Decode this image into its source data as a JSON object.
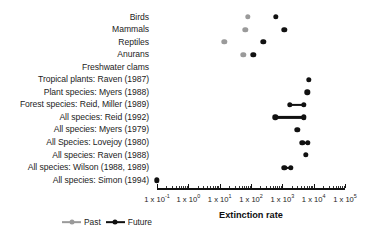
{
  "chart_data": {
    "type": "scatter",
    "title": "",
    "xlabel": "Extinction rate",
    "ylabel": "",
    "xscale": "log",
    "xlim": [
      0.1,
      100000
    ],
    "grid": false,
    "legend_position": "bottom-left",
    "tick_labels": [
      {
        "text": "1 x 10",
        "exp": "-1",
        "value": 0.1
      },
      {
        "text": "1 x 10",
        "exp": "0",
        "value": 1
      },
      {
        "text": "1 x 10",
        "exp": "1",
        "value": 10
      },
      {
        "text": "1 x 10",
        "exp": "2",
        "value": 100
      },
      {
        "text": "1 x 10",
        "exp": "3",
        "value": 1000
      },
      {
        "text": "1 x 10",
        "exp": "4",
        "value": 10000
      },
      {
        "text": "1 x 10",
        "exp": "5",
        "value": 100000
      }
    ],
    "series": [
      {
        "name": "Past",
        "color": "#9a9a9a"
      },
      {
        "name": "Future",
        "color": "#111111"
      }
    ],
    "categories": [
      "Birds",
      "Mammals",
      "Reptiles",
      "Anurans",
      "Freshwater clams",
      "Tropical plants: Raven (1987)",
      "Plant species: Myers (1988)",
      "Forest species: Reid, Miller (1989)",
      "All species: Reid (1992)",
      "All species: Myers (1979)",
      "All Species: Lovejoy (1980)",
      "All species: Raven (1988)",
      "All species: Wilson (1988, 1989)",
      "All species: Simon (1994)"
    ],
    "rows": [
      {
        "label": "Birds",
        "past": 80,
        "future": 630,
        "range": null
      },
      {
        "label": "Mammals",
        "past": 66,
        "future": 1150,
        "range": null
      },
      {
        "label": "Reptiles",
        "past": 14,
        "future": 250,
        "range": null
      },
      {
        "label": "Anurans",
        "past": 56,
        "future": 120,
        "range": null
      },
      {
        "label": "Freshwater clams",
        "past": null,
        "future": null,
        "range": null
      },
      {
        "label": "Tropical plants: Raven (1987)",
        "past": null,
        "future": 7000,
        "range": null
      },
      {
        "label": "Plant species: Myers (1988)",
        "past": null,
        "future": 6300,
        "range": null
      },
      {
        "label": "Forest species: Reid, Miller (1989)",
        "past": null,
        "future": null,
        "range": [
          1700,
          4800
        ]
      },
      {
        "label": "All species: Reid (1992)",
        "past": null,
        "future": null,
        "range": [
          600,
          4800
        ]
      },
      {
        "label": "All species: Myers (1979)",
        "past": null,
        "future": 3000,
        "range": null
      },
      {
        "label": "All Species: Lovejoy (1980)",
        "past": null,
        "future": null,
        "range": [
          4300,
          6600
        ]
      },
      {
        "label": "All species: Raven (1988)",
        "past": null,
        "future": 5600,
        "range": null
      },
      {
        "label": "All species: Wilson (1988, 1989)",
        "past": null,
        "future": null,
        "range": [
          1150,
          1900
        ]
      },
      {
        "label": "All species: Simon (1994)",
        "past": null,
        "future": 0.1,
        "range": null
      }
    ]
  },
  "legend": {
    "past_label": "Past",
    "future_label": "Future"
  },
  "axis": {
    "title": "Extinction rate"
  },
  "colors": {
    "past": "#9a9a9a",
    "future": "#111111",
    "background": "#ffffff",
    "text": "#1c1c1c"
  }
}
